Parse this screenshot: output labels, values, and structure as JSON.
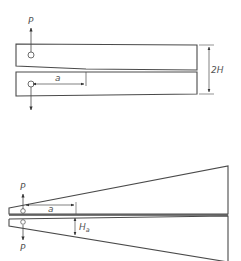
{
  "diagram": {
    "colors": {
      "stroke": "#4a4a4a",
      "label": "#555555",
      "background": "#ffffff"
    },
    "top_figure": {
      "name": "Double cantilever beam (uniform)",
      "labels": {
        "load_top": "P",
        "crack_length": "a",
        "height": "2H"
      }
    },
    "bottom_figure": {
      "name": "Tapered double cantilever beam",
      "labels": {
        "load_top": "P",
        "load_bottom": "P",
        "crack_length": "a",
        "arm_height": "H",
        "arm_height_subscript": "a"
      }
    }
  }
}
